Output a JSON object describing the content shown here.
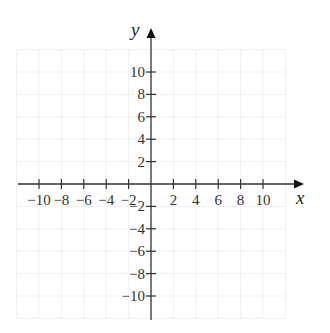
{
  "diagram": {
    "type": "coordinate-plane",
    "x_axis": {
      "label": "x",
      "ticks": [
        -10,
        -8,
        -6,
        -4,
        -2,
        2,
        4,
        6,
        8,
        10
      ],
      "tick_labels": [
        "−10",
        "−8",
        "−6",
        "−4",
        "−2",
        "2",
        "4",
        "6",
        "8",
        "10"
      ]
    },
    "y_axis": {
      "label": "y",
      "ticks": [
        10,
        8,
        6,
        4,
        2,
        -2,
        -4,
        -6,
        -8,
        -10
      ],
      "tick_labels": [
        "10",
        "8",
        "6",
        "4",
        "2",
        "−2",
        "−4",
        "−6",
        "−8",
        "−10"
      ]
    },
    "grid": {
      "visible": true,
      "step": 2,
      "color": "#f1f1f1"
    },
    "colors": {
      "axis": "#333333",
      "text": "#333333"
    }
  },
  "chart_data": {
    "type": "scatter",
    "title": "",
    "xlabel": "x",
    "ylabel": "y",
    "xlim": [
      -12,
      12
    ],
    "ylim": [
      -12,
      12
    ],
    "x_ticks": [
      -10,
      -8,
      -6,
      -4,
      -2,
      2,
      4,
      6,
      8,
      10
    ],
    "y_ticks": [
      -10,
      -8,
      -6,
      -4,
      -2,
      2,
      4,
      6,
      8,
      10
    ],
    "grid": true,
    "series": []
  }
}
